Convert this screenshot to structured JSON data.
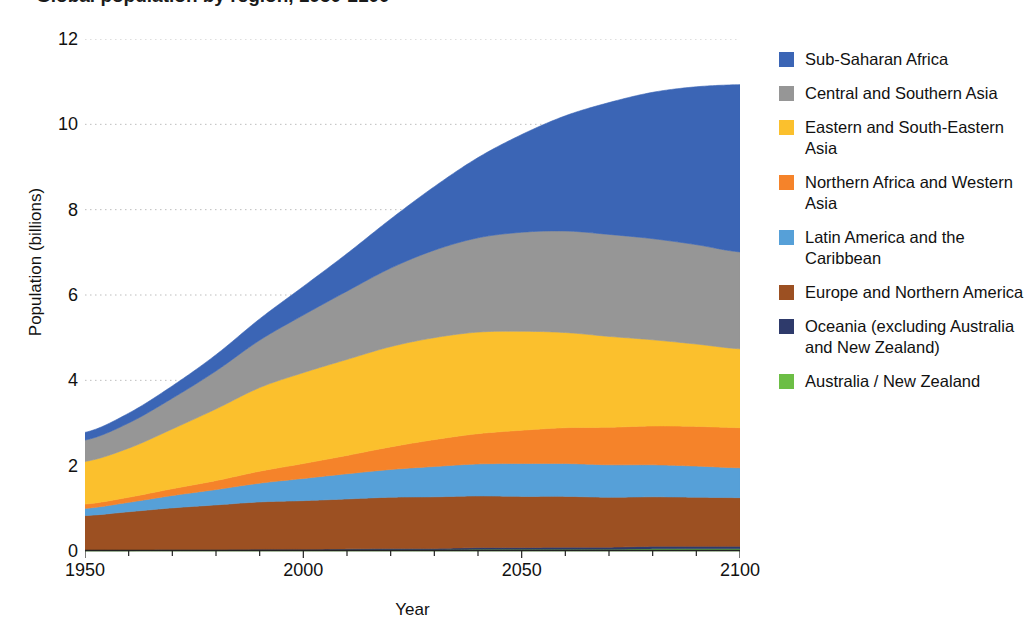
{
  "chart_data": {
    "type": "area",
    "stacked": true,
    "title": "Global population by region, 1950-2100",
    "xlabel": "Year",
    "ylabel": "Population (billions)",
    "xlim": [
      1950,
      2100
    ],
    "ylim": [
      0,
      12
    ],
    "xticks": [
      1950,
      2000,
      2050,
      2100
    ],
    "xtick_labels": [
      "1950",
      "2000",
      "2050",
      "2100"
    ],
    "xminor_tick_step": 10,
    "yticks": [
      0,
      2,
      4,
      6,
      8,
      10,
      12
    ],
    "ytick_labels": [
      "0",
      "2",
      "4",
      "6",
      "8",
      "10",
      "12"
    ],
    "grid": "horizontal-dotted",
    "legend_position": "right",
    "x": [
      1950,
      1960,
      1970,
      1980,
      1990,
      2000,
      2010,
      2020,
      2030,
      2040,
      2050,
      2060,
      2070,
      2080,
      2090,
      2100
    ],
    "series": [
      {
        "name": "Australia / New Zealand",
        "color": "#6CBE45",
        "values": [
          0.01,
          0.01,
          0.02,
          0.02,
          0.02,
          0.02,
          0.03,
          0.03,
          0.03,
          0.04,
          0.04,
          0.04,
          0.04,
          0.05,
          0.05,
          0.05
        ]
      },
      {
        "name": "Oceania (excluding Australia and New Zealand)",
        "color": "#2E3A6B",
        "values": [
          0.01,
          0.01,
          0.01,
          0.01,
          0.02,
          0.02,
          0.02,
          0.03,
          0.03,
          0.04,
          0.04,
          0.05,
          0.05,
          0.06,
          0.06,
          0.06
        ]
      },
      {
        "name": "Europe and Northern America",
        "color": "#9C5022",
        "values": [
          0.81,
          0.9,
          0.98,
          1.05,
          1.11,
          1.14,
          1.17,
          1.2,
          1.21,
          1.21,
          1.2,
          1.19,
          1.17,
          1.16,
          1.15,
          1.14
        ]
      },
      {
        "name": "Latin America and the Caribbean",
        "color": "#56A0D8",
        "values": [
          0.17,
          0.22,
          0.29,
          0.36,
          0.44,
          0.52,
          0.59,
          0.65,
          0.71,
          0.75,
          0.77,
          0.77,
          0.76,
          0.75,
          0.73,
          0.7
        ]
      },
      {
        "name": "Northern Africa and Western Asia",
        "color": "#F5832A",
        "values": [
          0.1,
          0.12,
          0.16,
          0.21,
          0.28,
          0.35,
          0.43,
          0.53,
          0.63,
          0.71,
          0.78,
          0.84,
          0.88,
          0.91,
          0.93,
          0.94
        ]
      },
      {
        "name": "Eastern and South-Eastern Asia",
        "color": "#FBC02D",
        "values": [
          1.0,
          1.15,
          1.4,
          1.68,
          1.96,
          2.13,
          2.25,
          2.35,
          2.39,
          2.38,
          2.32,
          2.23,
          2.13,
          2.02,
          1.93,
          1.85
        ]
      },
      {
        "name": "Central and Southern Asia",
        "color": "#969696",
        "values": [
          0.5,
          0.59,
          0.72,
          0.89,
          1.11,
          1.35,
          1.6,
          1.84,
          2.05,
          2.21,
          2.32,
          2.38,
          2.39,
          2.37,
          2.33,
          2.27
        ]
      },
      {
        "name": "Sub-Saharan Africa",
        "color": "#3B65B5",
        "values": [
          0.18,
          0.23,
          0.29,
          0.38,
          0.5,
          0.67,
          0.88,
          1.15,
          1.49,
          1.88,
          2.29,
          2.7,
          3.09,
          3.43,
          3.7,
          3.92
        ]
      }
    ],
    "legend_entries": [
      {
        "label": "Sub-Saharan Africa",
        "color": "#3B65B5"
      },
      {
        "label": "Central and Southern Asia",
        "color": "#969696"
      },
      {
        "label": "Eastern and South-Eastern Asia",
        "color": "#FBC02D"
      },
      {
        "label": "Northern Africa and Western Asia",
        "color": "#F5832A"
      },
      {
        "label": "Latin America and the Caribbean",
        "color": "#56A0D8"
      },
      {
        "label": "Europe and Northern America",
        "color": "#9C5022"
      },
      {
        "label": "Oceania (excluding Australia and New Zealand)",
        "color": "#2E3A6B"
      },
      {
        "label": "Australia / New Zealand",
        "color": "#6CBE45"
      }
    ]
  }
}
